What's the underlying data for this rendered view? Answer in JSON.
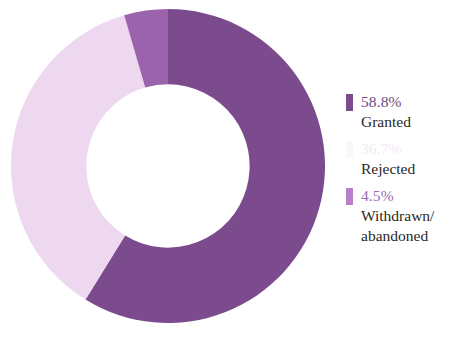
{
  "chart_data": {
    "type": "pie",
    "variant": "donut",
    "title": "",
    "subtitle": "",
    "xlabel": "",
    "ylabel": "",
    "grid": false,
    "legend_position": "right",
    "units": "percent",
    "total": 100.0,
    "start_angle_deg": 0,
    "direction": "clockwise",
    "inner_radius_ratio": 0.52,
    "categories": [
      "Granted",
      "Rejected",
      "Withdrawn/abandoned"
    ],
    "values": [
      58.8,
      36.7,
      4.5
    ],
    "colors": [
      "#7B4B8E",
      "#EED8EF",
      "#9B62AE"
    ],
    "slices": [
      {
        "label": "Granted",
        "value": 58.8,
        "display_value": "58.8%",
        "color": "#7B4B8E",
        "start_deg": 0.0,
        "end_deg": 211.68
      },
      {
        "label": "Rejected",
        "value": 36.7,
        "display_value": "36.7%",
        "color": "#EED8EF",
        "start_deg": 211.68,
        "end_deg": 343.8
      },
      {
        "label": "Withdrawn/abandoned",
        "value": 4.5,
        "display_value": "4.5%",
        "color": "#9B62AE",
        "start_deg": 343.8,
        "end_deg": 360.0
      }
    ]
  },
  "legend": {
    "entries": [
      {
        "value": "58.8%",
        "label": "Granted",
        "swatch_color": "#7B4B8E",
        "value_color": "#6E4A7F"
      },
      {
        "value": "36.7%",
        "label": "Rejected",
        "swatch_color": "#EED8EF",
        "value_color": "#C79AD2"
      },
      {
        "value": "4.5%",
        "label": "Withdrawn/\nabandoned",
        "swatch_color": "#B87FCB",
        "value_color": "#9B6BAE"
      }
    ]
  },
  "colors": {
    "granted": "#7B4B8E",
    "rejected": "#EED8EF",
    "withdrawn": "#9B62AE",
    "background": "#FFFFFF",
    "label_text": "#2B2724"
  }
}
